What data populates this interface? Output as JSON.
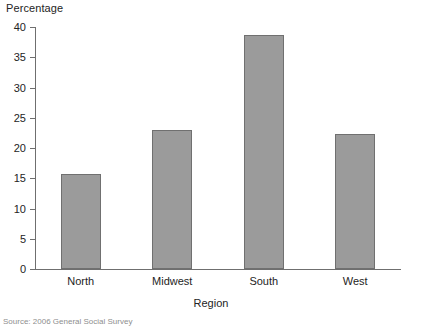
{
  "chart_data": {
    "type": "bar",
    "title": "",
    "ylabel": "Percentage",
    "xlabel": "Region",
    "categories": [
      "North",
      "Midwest",
      "South",
      "West"
    ],
    "values": [
      15.7,
      23.0,
      38.7,
      22.3
    ],
    "ylim": [
      0,
      40
    ],
    "yticks": [
      0,
      5,
      10,
      15,
      20,
      25,
      30,
      35,
      40
    ],
    "ytick_labels": [
      "0",
      "5",
      "10",
      "15",
      "20",
      "25",
      "30",
      "35",
      "40"
    ],
    "grid": false,
    "legend": "none",
    "bar_color": "#9b9b9b",
    "bar_border_color": "#707070",
    "axis_color": "#6f6f6f",
    "text_color": "#242424"
  },
  "source": {
    "note": "Source: 2006 General Social Survey"
  }
}
